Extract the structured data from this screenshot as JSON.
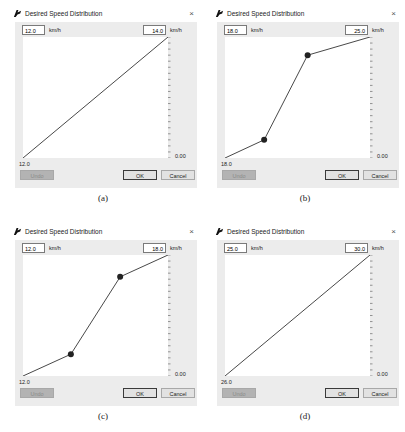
{
  "dialog_title": "Desired Speed Distribution",
  "close_glyph": "×",
  "unit": "km/h",
  "buttons": {
    "undo": "Undo",
    "ok": "OK",
    "cancel": "Cancel"
  },
  "y_axis_zero_label": "0.00",
  "panels": [
    {
      "id": "a",
      "caption": "(a)",
      "min_speed": "12.0",
      "max_speed": "14.0",
      "x_axis_label": "12.0",
      "points": [
        [
          0,
          0
        ],
        [
          1,
          1
        ]
      ],
      "markers": []
    },
    {
      "id": "b",
      "caption": "(b)",
      "min_speed": "18.0",
      "max_speed": "25.0",
      "x_axis_label": "18.0",
      "points": [
        [
          0,
          0
        ],
        [
          0.27,
          0.15
        ],
        [
          0.57,
          0.85
        ],
        [
          1,
          1
        ]
      ],
      "markers": [
        [
          0.27,
          0.15
        ],
        [
          0.57,
          0.85
        ]
      ]
    },
    {
      "id": "c",
      "caption": "(c)",
      "min_speed": "12.0",
      "max_speed": "18.0",
      "x_axis_label": "12.0",
      "points": [
        [
          0,
          0
        ],
        [
          0.33,
          0.18
        ],
        [
          0.67,
          0.82
        ],
        [
          1,
          1
        ]
      ],
      "markers": [
        [
          0.33,
          0.18
        ],
        [
          0.67,
          0.82
        ]
      ]
    },
    {
      "id": "d",
      "caption": "(d)",
      "min_speed": "25.0",
      "max_speed": "30.0",
      "x_axis_label": "26.0",
      "points": [
        [
          0,
          0
        ],
        [
          1,
          1
        ]
      ],
      "markers": []
    }
  ],
  "chart_data": [
    {
      "type": "line",
      "title": "Desired Speed Distribution (a)",
      "x": [
        12.0,
        14.0
      ],
      "y": [
        0.0,
        1.0
      ],
      "xlabel": "km/h",
      "ylabel": "cumulative"
    },
    {
      "type": "line",
      "title": "Desired Speed Distribution (b)",
      "x": [
        18.0,
        19.9,
        22.0,
        25.0
      ],
      "y": [
        0.0,
        0.15,
        0.85,
        1.0
      ],
      "xlabel": "km/h",
      "ylabel": "cumulative"
    },
    {
      "type": "line",
      "title": "Desired Speed Distribution (c)",
      "x": [
        12.0,
        14.0,
        16.0,
        18.0
      ],
      "y": [
        0.0,
        0.18,
        0.82,
        1.0
      ],
      "xlabel": "km/h",
      "ylabel": "cumulative"
    },
    {
      "type": "line",
      "title": "Desired Speed Distribution (d)",
      "x": [
        25.0,
        30.0
      ],
      "y": [
        0.0,
        1.0
      ],
      "xlabel": "km/h",
      "ylabel": "cumulative"
    }
  ]
}
